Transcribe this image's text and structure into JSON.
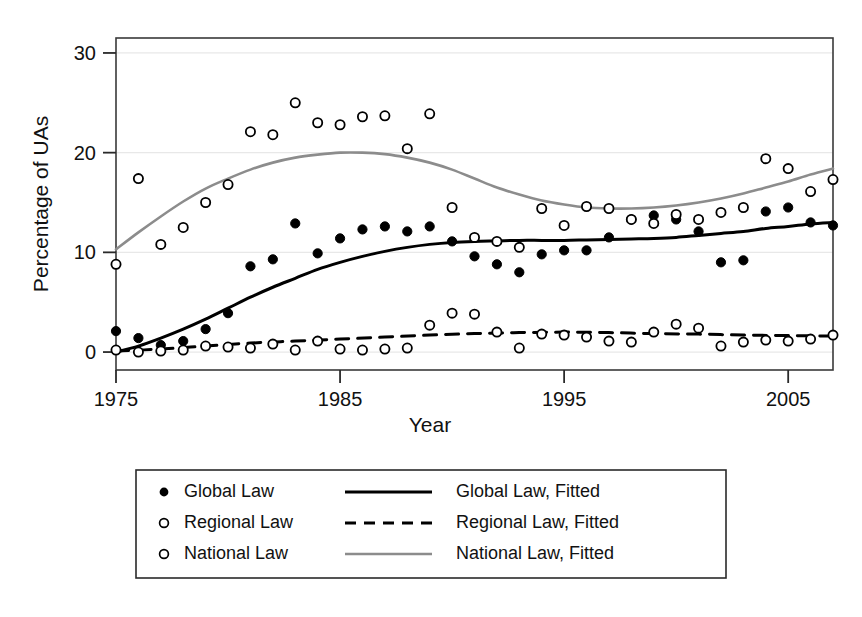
{
  "chart_data": {
    "type": "scatter",
    "title": "",
    "xlabel": "Year",
    "ylabel": "Percentage of UAs",
    "xlim": [
      1975,
      2007
    ],
    "ylim": [
      -1.8,
      31.5
    ],
    "xticks": [
      1975,
      1985,
      1995,
      2005
    ],
    "yticks": [
      0,
      10,
      20,
      30
    ],
    "grid": "horizontal",
    "legend_position": "below-plot",
    "series": [
      {
        "name": "Global Law",
        "marker": "filled-circle",
        "color": "#000000",
        "x": [
          1975,
          1976,
          1977,
          1978,
          1979,
          1980,
          1981,
          1982,
          1983,
          1984,
          1985,
          1986,
          1987,
          1988,
          1989,
          1990,
          1991,
          1992,
          1993,
          1994,
          1995,
          1996,
          1997,
          1998,
          1999,
          2000,
          2001,
          2002,
          2003,
          2004,
          2005,
          2006,
          2007
        ],
        "y": [
          2.1,
          1.4,
          0.7,
          1.1,
          2.3,
          3.9,
          8.6,
          9.3,
          12.9,
          9.9,
          11.4,
          12.3,
          12.6,
          12.1,
          12.6,
          11.1,
          9.6,
          8.8,
          8.0,
          9.8,
          10.2,
          10.2,
          11.5,
          13.3,
          13.7,
          13.3,
          12.1,
          9.0,
          9.2,
          14.1,
          14.5,
          13.0,
          12.7
        ]
      },
      {
        "name": "Regional Law",
        "marker": "open-circle",
        "color": "#000000",
        "x": [
          1975,
          1976,
          1977,
          1978,
          1979,
          1980,
          1981,
          1982,
          1983,
          1984,
          1985,
          1986,
          1987,
          1988,
          1989,
          1990,
          1991,
          1992,
          1993,
          1994,
          1995,
          1996,
          1997,
          1998,
          1999,
          2000,
          2001,
          2002,
          2003,
          2004,
          2005,
          2006,
          2007
        ],
        "y": [
          0.2,
          0.0,
          0.1,
          0.2,
          0.6,
          0.5,
          0.4,
          0.8,
          0.2,
          1.1,
          0.3,
          0.2,
          0.3,
          0.4,
          2.7,
          3.9,
          3.8,
          2.0,
          0.4,
          1.8,
          1.7,
          1.5,
          1.1,
          1.0,
          2.0,
          2.8,
          2.4,
          0.6,
          1.0,
          1.2,
          1.1,
          1.3,
          1.7
        ]
      },
      {
        "name": "National Law",
        "marker": "open-circle",
        "color": "#000000",
        "x": [
          1975,
          1976,
          1977,
          1978,
          1979,
          1980,
          1981,
          1982,
          1983,
          1984,
          1985,
          1986,
          1987,
          1988,
          1989,
          1990,
          1991,
          1992,
          1993,
          1994,
          1995,
          1996,
          1997,
          1998,
          1999,
          2000,
          2001,
          2002,
          2003,
          2004,
          2005,
          2006,
          2007
        ],
        "y": [
          8.8,
          17.4,
          10.8,
          12.5,
          15.0,
          16.8,
          22.1,
          21.8,
          25.0,
          23.0,
          22.8,
          23.6,
          23.7,
          20.4,
          23.9,
          14.5,
          11.5,
          11.1,
          10.5,
          14.4,
          12.7,
          14.6,
          14.4,
          13.3,
          12.9,
          13.8,
          13.3,
          14.0,
          14.5,
          19.4,
          18.4,
          16.1,
          17.3
        ]
      }
    ],
    "fits": [
      {
        "name": "Global Law, Fitted",
        "style": "solid",
        "color": "#000000",
        "points": [
          [
            1975,
            0.0
          ],
          [
            1976,
            0.6
          ],
          [
            1977,
            1.4
          ],
          [
            1978,
            2.3
          ],
          [
            1979,
            3.3
          ],
          [
            1980,
            4.4
          ],
          [
            1981,
            5.5
          ],
          [
            1982,
            6.5
          ],
          [
            1983,
            7.4
          ],
          [
            1984,
            8.3
          ],
          [
            1985,
            9.0
          ],
          [
            1986,
            9.6
          ],
          [
            1987,
            10.1
          ],
          [
            1988,
            10.5
          ],
          [
            1989,
            10.8
          ],
          [
            1990,
            11.0
          ],
          [
            1991,
            11.1
          ],
          [
            1992,
            11.15
          ],
          [
            1993,
            11.2
          ],
          [
            1994,
            11.2
          ],
          [
            1995,
            11.2
          ],
          [
            1996,
            11.25
          ],
          [
            1997,
            11.3
          ],
          [
            1998,
            11.35
          ],
          [
            1999,
            11.4
          ],
          [
            2000,
            11.5
          ],
          [
            2001,
            11.7
          ],
          [
            2002,
            11.9
          ],
          [
            2003,
            12.1
          ],
          [
            2004,
            12.4
          ],
          [
            2005,
            12.6
          ],
          [
            2006,
            12.85
          ],
          [
            2007,
            13.0
          ]
        ]
      },
      {
        "name": "Regional Law, Fitted",
        "style": "dashed",
        "color": "#000000",
        "points": [
          [
            1975,
            0.1
          ],
          [
            1977,
            0.3
          ],
          [
            1979,
            0.6
          ],
          [
            1981,
            0.9
          ],
          [
            1983,
            1.1
          ],
          [
            1985,
            1.3
          ],
          [
            1987,
            1.5
          ],
          [
            1989,
            1.7
          ],
          [
            1991,
            1.85
          ],
          [
            1993,
            1.95
          ],
          [
            1995,
            2.0
          ],
          [
            1997,
            1.95
          ],
          [
            1999,
            1.85
          ],
          [
            2001,
            1.8
          ],
          [
            2003,
            1.7
          ],
          [
            2005,
            1.65
          ],
          [
            2007,
            1.6
          ]
        ]
      },
      {
        "name": "National Law, Fitted",
        "style": "solid-gray",
        "color": "#8c8c8c",
        "points": [
          [
            1975,
            10.3
          ],
          [
            1976,
            12.0
          ],
          [
            1977,
            13.6
          ],
          [
            1978,
            15.1
          ],
          [
            1979,
            16.4
          ],
          [
            1980,
            17.4
          ],
          [
            1981,
            18.3
          ],
          [
            1982,
            19.0
          ],
          [
            1983,
            19.5
          ],
          [
            1984,
            19.8
          ],
          [
            1985,
            20.0
          ],
          [
            1986,
            20.0
          ],
          [
            1987,
            19.85
          ],
          [
            1988,
            19.5
          ],
          [
            1989,
            19.0
          ],
          [
            1990,
            18.3
          ],
          [
            1991,
            17.4
          ],
          [
            1992,
            16.5
          ],
          [
            1993,
            15.8
          ],
          [
            1994,
            15.2
          ],
          [
            1995,
            14.8
          ],
          [
            1996,
            14.5
          ],
          [
            1997,
            14.4
          ],
          [
            1998,
            14.4
          ],
          [
            1999,
            14.5
          ],
          [
            2000,
            14.7
          ],
          [
            2001,
            15.0
          ],
          [
            2002,
            15.4
          ],
          [
            2003,
            15.9
          ],
          [
            2004,
            16.5
          ],
          [
            2005,
            17.1
          ],
          [
            2006,
            17.8
          ],
          [
            2007,
            18.4
          ]
        ]
      }
    ]
  },
  "axes": {
    "ylabel": "Percentage of UAs",
    "xlabel": "Year",
    "yticks": [
      "0",
      "10",
      "20",
      "30"
    ],
    "xticks": [
      "1975",
      "1985",
      "1995",
      "2005"
    ]
  },
  "legend": {
    "rows": [
      {
        "marker": "filled-circle",
        "marker_label": "Global Law",
        "line": "solid-black",
        "line_label": "Global Law, Fitted"
      },
      {
        "marker": "open-circle",
        "marker_label": "Regional Law",
        "line": "dashed-black",
        "line_label": "Regional Law, Fitted"
      },
      {
        "marker": "open-circle",
        "marker_label": "National Law",
        "line": "solid-gray",
        "line_label": "National Law, Fitted"
      }
    ]
  },
  "colors": {
    "ink": "#000000",
    "gray_series": "#8c8c8c",
    "gridline": "#e8e8e8",
    "frame": "#3a3a3a",
    "background": "#ffffff"
  },
  "caption": {
    "text": ""
  }
}
